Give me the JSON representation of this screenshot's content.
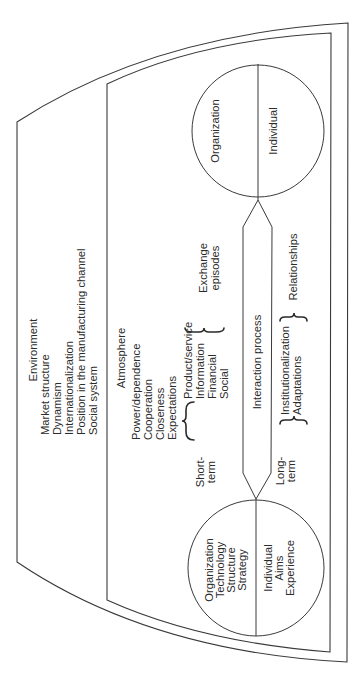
{
  "diagram": {
    "orientation": "rotated 90 degrees counter-clockwise",
    "environment": {
      "title": "Environment",
      "items": [
        "Market structure",
        "Dynamism",
        "Internationalization",
        "Position in the manufacturing channel",
        "Social system"
      ]
    },
    "atmosphere": {
      "title": "Atmosphere",
      "items": [
        "Power/dependence",
        "Cooperation",
        "Closeness",
        "Expectations"
      ]
    },
    "party_a": {
      "top_half": [
        "Organization",
        "Technology",
        "Structure",
        "Strategy"
      ],
      "bottom_half": [
        "Individual",
        "Aims",
        "Experience"
      ]
    },
    "party_b": {
      "top_half": [
        "Organization"
      ],
      "bottom_half": [
        "Individual"
      ]
    },
    "short_term": {
      "label_1": "Short-",
      "label_2": "term",
      "items": [
        "Product/service",
        "Information",
        "Financial",
        "Social"
      ],
      "result_1": "Exchange",
      "result_2": "episodes"
    },
    "interaction": {
      "label": "Interaction process"
    },
    "long_term": {
      "label_1": "Long-",
      "label_2": "term",
      "items": [
        "Institutionalization",
        "Adaptations"
      ],
      "result": "Relationships"
    }
  }
}
